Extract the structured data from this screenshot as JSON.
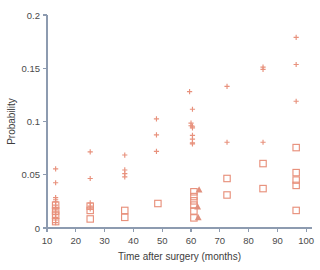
{
  "chart_data": {
    "type": "scatter",
    "title": "",
    "xlabel": "Time after surgery (months)",
    "ylabel": "Probability",
    "xlim": [
      10,
      102
    ],
    "ylim": [
      0,
      0.2
    ],
    "xticks": [
      10,
      20,
      30,
      40,
      50,
      60,
      70,
      80,
      90,
      100
    ],
    "xticklabels": [
      "10",
      "20",
      "30",
      "40",
      "50",
      "60",
      "70",
      "80",
      "90",
      "100"
    ],
    "yticks": [
      0,
      0.05,
      0.1,
      0.15,
      0.2
    ],
    "yticklabels": [
      "0",
      "0.05",
      "0.1",
      "0.15",
      "0.2"
    ],
    "grid": false,
    "legend": "none",
    "marker_color": "#e8917c",
    "axis_color": "#8d9bb0",
    "background": "#ffffff",
    "series": [
      {
        "name": "plus",
        "marker": "plus",
        "points": [
          [
            13.0,
            0.0555
          ],
          [
            13.0,
            0.0425
          ],
          [
            13.0,
            0.0285
          ],
          [
            13.0,
            0.0265
          ],
          [
            13.0,
            0.0245
          ],
          [
            13.0,
            0.0215
          ],
          [
            13.0,
            0.0195
          ],
          [
            13.0,
            0.017
          ],
          [
            13.0,
            0.015
          ],
          [
            13.0,
            0.0125
          ],
          [
            13.0,
            0.01
          ],
          [
            13.0,
            0.0075
          ],
          [
            13.0,
            0.005
          ],
          [
            25.0,
            0.0715
          ],
          [
            25.0,
            0.0465
          ],
          [
            25.0,
            0.0235
          ],
          [
            25.0,
            0.0205
          ],
          [
            25.0,
            0.018
          ],
          [
            37.0,
            0.0685
          ],
          [
            37.0,
            0.0545
          ],
          [
            37.0,
            0.051
          ],
          [
            37.0,
            0.048
          ],
          [
            48.0,
            0.1025
          ],
          [
            48.0,
            0.0875
          ],
          [
            48.0,
            0.072
          ],
          [
            59.5,
            0.128
          ],
          [
            60.5,
            0.1115
          ],
          [
            60.0,
            0.0985
          ],
          [
            60.0,
            0.096
          ],
          [
            60.5,
            0.094
          ],
          [
            60.5,
            0.0955
          ],
          [
            60.5,
            0.087
          ],
          [
            60.5,
            0.0835
          ],
          [
            60.5,
            0.08
          ],
          [
            60.5,
            0.079
          ],
          [
            72.5,
            0.133
          ],
          [
            72.5,
            0.0805
          ],
          [
            85.0,
            0.151
          ],
          [
            85.0,
            0.149
          ],
          [
            85.0,
            0.0805
          ],
          [
            96.5,
            0.179
          ],
          [
            96.5,
            0.1535
          ],
          [
            96.5,
            0.119
          ]
        ]
      },
      {
        "name": "square",
        "marker": "square",
        "points": [
          [
            13.0,
            0.0215
          ],
          [
            13.0,
            0.016
          ],
          [
            13.0,
            0.012
          ],
          [
            13.0,
            0.006
          ],
          [
            25.0,
            0.0205
          ],
          [
            25.0,
            0.0165
          ],
          [
            25.0,
            0.0085
          ],
          [
            37.0,
            0.0165
          ],
          [
            37.0,
            0.01
          ],
          [
            48.5,
            0.023
          ],
          [
            61.0,
            0.034
          ],
          [
            61.0,
            0.0295
          ],
          [
            61.0,
            0.0255
          ],
          [
            61.0,
            0.0215
          ],
          [
            61.0,
            0.016
          ],
          [
            61.0,
            0.0095
          ],
          [
            72.5,
            0.0465
          ],
          [
            72.5,
            0.031
          ],
          [
            85.0,
            0.0605
          ],
          [
            85.0,
            0.037
          ],
          [
            96.5,
            0.0755
          ],
          [
            96.5,
            0.052
          ],
          [
            96.5,
            0.045
          ],
          [
            96.5,
            0.04
          ],
          [
            96.5,
            0.0165
          ]
        ]
      },
      {
        "name": "triangle",
        "marker": "triangle",
        "points": [
          [
            62.8,
            0.036
          ],
          [
            62.3,
            0.02
          ],
          [
            62.5,
            0.01
          ]
        ]
      }
    ]
  }
}
